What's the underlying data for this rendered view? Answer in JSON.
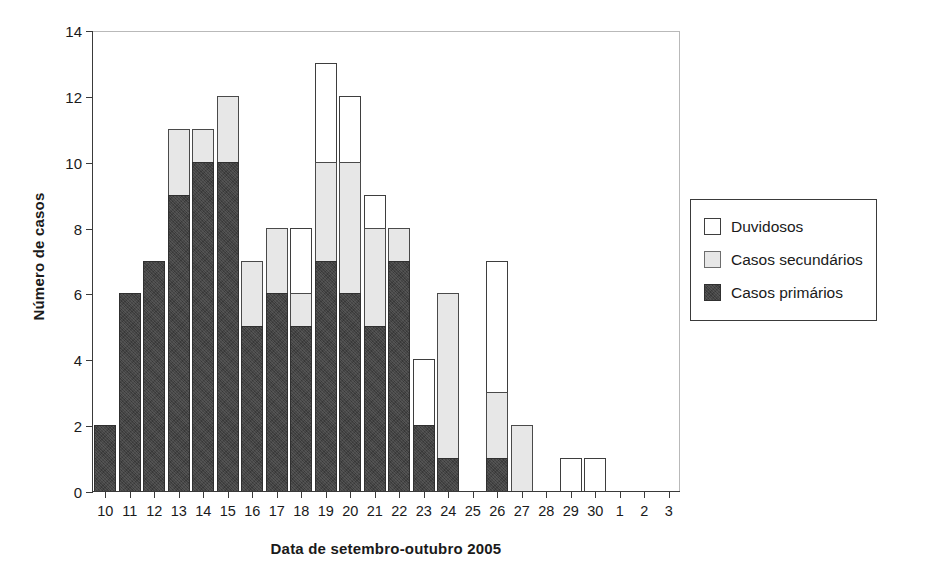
{
  "chart_data": {
    "type": "bar",
    "subtype": "stacked-bar",
    "title": "",
    "xlabel": "Data de setembro-outubro 2005",
    "ylabel": "Número de casos",
    "ylim": [
      0,
      14
    ],
    "yticks": [
      0,
      2,
      4,
      6,
      8,
      10,
      12,
      14
    ],
    "grid": false,
    "legend_position": "right",
    "categories": [
      "10",
      "11",
      "12",
      "13",
      "14",
      "15",
      "16",
      "17",
      "18",
      "19",
      "20",
      "21",
      "22",
      "23",
      "24",
      "25",
      "26",
      "27",
      "28",
      "29",
      "30",
      "1",
      "2",
      "3"
    ],
    "series": [
      {
        "name": "Casos primários",
        "color": "#434343",
        "values": [
          2,
          6,
          7,
          9,
          10,
          10,
          5,
          6,
          5,
          7,
          6,
          5,
          7,
          2,
          1,
          0,
          1,
          0,
          0,
          0,
          0,
          0,
          0,
          0
        ]
      },
      {
        "name": "Casos secundários",
        "color": "#e7e7e7",
        "values": [
          0,
          0,
          0,
          2,
          1,
          2,
          2,
          2,
          1,
          3,
          4,
          3,
          1,
          0,
          5,
          0,
          2,
          2,
          0,
          0,
          0,
          0,
          0,
          0
        ]
      },
      {
        "name": "Duvidosos",
        "color": "#ffffff",
        "values": [
          0,
          0,
          0,
          0,
          0,
          0,
          0,
          0,
          2,
          3,
          2,
          1,
          0,
          2,
          0,
          0,
          4,
          0,
          0,
          1,
          1,
          0,
          0,
          0
        ]
      }
    ],
    "totals": [
      2,
      6,
      7,
      11,
      11,
      12,
      7,
      8,
      8,
      13,
      12,
      9,
      8,
      4,
      6,
      0,
      7,
      2,
      0,
      1,
      1,
      0,
      0,
      0
    ]
  },
  "legend": {
    "items": [
      {
        "label": "Duvidosos",
        "swatch": "doubtful"
      },
      {
        "label": "Casos secundários",
        "swatch": "secondary"
      },
      {
        "label": "Casos primários",
        "swatch": "primary"
      }
    ]
  }
}
